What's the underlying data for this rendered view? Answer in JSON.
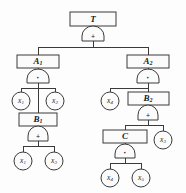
{
  "diagram": {
    "colors": {
      "stroke": "#3a3a3a",
      "text": "#1b1b1b",
      "fill": "#fbfbfb",
      "background": "#fdfdfd"
    },
    "operators": {
      "or": "+",
      "and": "·"
    },
    "nodes": {
      "top": {
        "label": "T",
        "sub": ""
      },
      "a1": {
        "label": "A",
        "sub": "1"
      },
      "a2": {
        "label": "A",
        "sub": "2"
      },
      "b1": {
        "label": "B",
        "sub": "1"
      },
      "b2": {
        "label": "B",
        "sub": "2"
      },
      "c": {
        "label": "C",
        "sub": ""
      }
    },
    "gates": {
      "g_top": {
        "op": "+",
        "type": "or"
      },
      "g_a1": {
        "op": "·",
        "type": "and"
      },
      "g_a2": {
        "op": "·",
        "type": "and"
      },
      "g_b1": {
        "op": "+",
        "type": "or"
      },
      "g_b2": {
        "op": "+",
        "type": "or"
      },
      "g_c": {
        "op": "·",
        "type": "and"
      }
    },
    "events": {
      "e_a1_left": {
        "label": "x",
        "sub": "1"
      },
      "e_a1_right": {
        "label": "x",
        "sub": "2"
      },
      "e_b1_left": {
        "label": "x",
        "sub": "1"
      },
      "e_b1_right": {
        "label": "x",
        "sub": "3"
      },
      "e_a2_left": {
        "label": "x",
        "sub": "4"
      },
      "e_b2_right": {
        "label": "x",
        "sub": "3"
      },
      "e_c_left": {
        "label": "x",
        "sub": "4"
      },
      "e_c_right": {
        "label": "x",
        "sub": "5"
      }
    }
  }
}
